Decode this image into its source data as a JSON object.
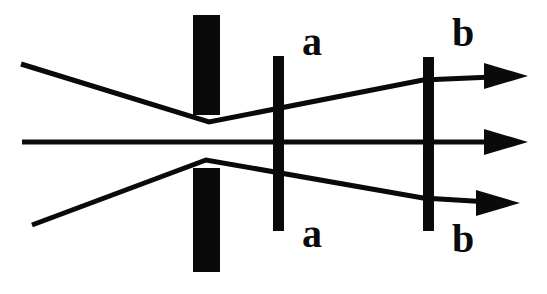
{
  "figure": {
    "canvas": {
      "width": 547,
      "height": 294
    },
    "colors": {
      "background": "#ffffff",
      "ink": "#0a0a0a"
    }
  },
  "labels": {
    "plane_a_top": "a",
    "plane_a_bottom": "a",
    "plane_b_top": "b",
    "plane_b_bottom": "b"
  },
  "chart_data": {
    "type": "diagram",
    "xlabel": "",
    "ylabel": "",
    "xlim": [
      0,
      547
    ],
    "ylim": [
      0,
      294
    ],
    "grid": false,
    "legend": null,
    "optical_axis_y": 142,
    "barriers": [
      {
        "name": "aperture-stop-upper-block",
        "shape": "rect",
        "x": 193,
        "y": 15,
        "width": 27,
        "height": 100,
        "label": ""
      },
      {
        "name": "aperture-stop-lower-block",
        "shape": "rect",
        "x": 193,
        "y": 168,
        "width": 27,
        "height": 104,
        "label": ""
      },
      {
        "name": "image-plane-a",
        "shape": "rect",
        "x": 273,
        "y": 56,
        "width": 11,
        "height": 175,
        "label": "a"
      },
      {
        "name": "image-plane-b",
        "shape": "rect",
        "x": 423,
        "y": 57,
        "width": 11,
        "height": 174,
        "label": "b"
      }
    ],
    "rays": [
      {
        "name": "upper-ray",
        "points": [
          [
            21,
            64
          ],
          [
            209,
            122
          ],
          [
            423,
            80
          ],
          [
            516,
            76
          ]
        ],
        "stroke_width": 5,
        "arrowhead": true,
        "arrow_tip": [
          528,
          76
        ]
      },
      {
        "name": "axial-ray",
        "points": [
          [
            22,
            142
          ],
          [
            516,
            142
          ]
        ],
        "stroke_width": 5,
        "arrowhead": true,
        "arrow_tip": [
          528,
          142
        ]
      },
      {
        "name": "lower-ray",
        "points": [
          [
            32,
            225
          ],
          [
            206,
            160
          ],
          [
            423,
            198
          ],
          [
            506,
            203
          ]
        ],
        "stroke_width": 5,
        "arrowhead": true,
        "arrow_tip": [
          520,
          203
        ]
      }
    ],
    "arrowheads": [
      {
        "name": "upper-arrowhead",
        "tip": [
          528,
          76
        ],
        "length": 44,
        "half_width": 13
      },
      {
        "name": "axial-arrowhead",
        "tip": [
          528,
          142
        ],
        "length": 44,
        "half_width": 13
      },
      {
        "name": "lower-arrowhead",
        "tip": [
          520,
          203
        ],
        "length": 44,
        "half_width": 13
      }
    ],
    "text_labels": [
      {
        "name": "label-a-top",
        "text": "a",
        "x": 312,
        "y": 55
      },
      {
        "name": "label-a-bottom",
        "text": "a",
        "x": 312,
        "y": 247
      },
      {
        "name": "label-b-top",
        "text": "b",
        "x": 463,
        "y": 46
      },
      {
        "name": "label-b-bottom",
        "text": "b",
        "x": 463,
        "y": 252
      }
    ]
  }
}
